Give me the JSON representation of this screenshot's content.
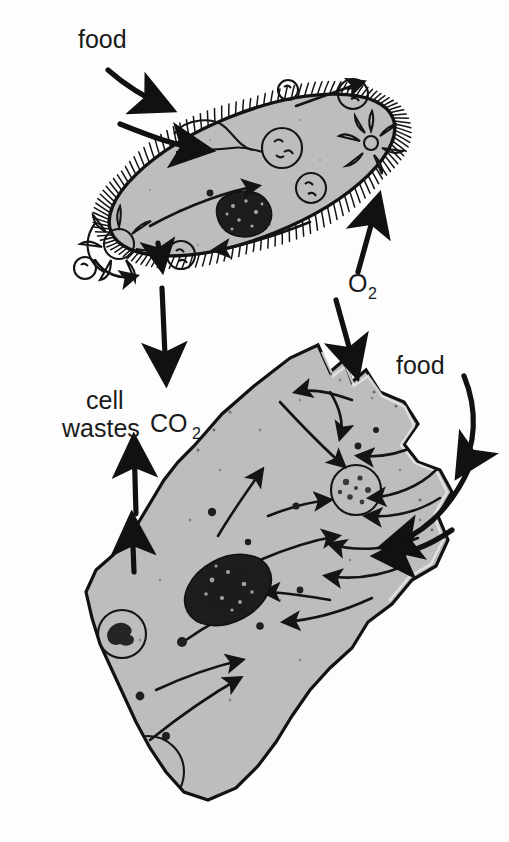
{
  "figure": {
    "type": "diagram",
    "organisms": [
      {
        "name": "paramecium",
        "position": "top",
        "features": [
          "cilia",
          "oral groove",
          "gullet",
          "food vacuoles",
          "contractile vacuoles",
          "macronucleus"
        ]
      },
      {
        "name": "amoeba",
        "position": "bottom",
        "features": [
          "pseudopods",
          "nucleus",
          "food vacuoles",
          "contractile vacuole",
          "cytoplasmic streaming"
        ]
      }
    ]
  },
  "labels": {
    "food_top": "food",
    "food_right": "food",
    "oxygen": "O",
    "oxygen_sub": "2",
    "carbon_dioxide": "CO",
    "carbon_dioxide_sub": "2",
    "cell_wastes_line1": "cell",
    "cell_wastes_line2": "wastes"
  },
  "colors": {
    "background": "#fdfdfd",
    "cytoplasm": "#bdbdbd",
    "outline": "#121212",
    "nucleus": "#1d1d1d",
    "text": "#1a1a1a"
  }
}
